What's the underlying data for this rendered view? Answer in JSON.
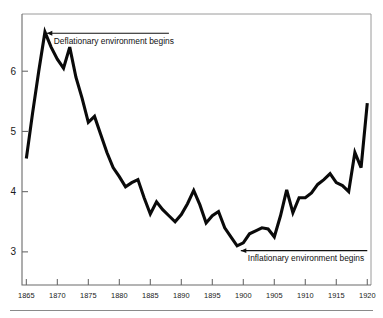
{
  "chart_data": {
    "type": "line",
    "title": "",
    "subtitle": "",
    "xlabel": "",
    "ylabel": "",
    "xlim": [
      1864.3,
      1920.6
    ],
    "ylim": [
      2.45,
      6.95
    ],
    "grid": false,
    "legend_position": "none",
    "x_ticks": [
      1865,
      1870,
      1875,
      1880,
      1885,
      1890,
      1895,
      1900,
      1905,
      1910,
      1915,
      1920
    ],
    "x_tick_labels": [
      "1865",
      "1870",
      "1875",
      "1880",
      "1885",
      "1890",
      "1895",
      "1900",
      "1905",
      "1910",
      "1915",
      "1920"
    ],
    "y_ticks": [
      3,
      4,
      5,
      6
    ],
    "y_tick_labels": [
      "3",
      "4",
      "5",
      "6"
    ],
    "series": [
      {
        "name": "Long-term interest rate",
        "color": "#0a0a0a",
        "x": [
          1865,
          1866,
          1867,
          1868,
          1869,
          1870,
          1871,
          1872,
          1873,
          1874,
          1875,
          1876,
          1877,
          1878,
          1879,
          1880,
          1881,
          1882,
          1883,
          1884,
          1885,
          1886,
          1887,
          1888,
          1889,
          1890,
          1891,
          1892,
          1893,
          1894,
          1895,
          1896,
          1897,
          1898,
          1899,
          1900,
          1901,
          1902,
          1903,
          1904,
          1905,
          1906,
          1907,
          1908,
          1909,
          1910,
          1911,
          1912,
          1913,
          1914,
          1915,
          1916,
          1917,
          1918,
          1919,
          1920
        ],
        "values": [
          4.55,
          5.3,
          6.0,
          6.65,
          6.4,
          6.2,
          6.05,
          6.4,
          5.9,
          5.55,
          5.15,
          5.25,
          4.95,
          4.65,
          4.4,
          4.25,
          4.08,
          4.15,
          4.2,
          3.9,
          3.63,
          3.83,
          3.7,
          3.6,
          3.5,
          3.62,
          3.8,
          4.02,
          3.78,
          3.48,
          3.6,
          3.67,
          3.4,
          3.25,
          3.1,
          3.15,
          3.3,
          3.35,
          3.4,
          3.38,
          3.25,
          3.6,
          4.03,
          3.65,
          3.9,
          3.9,
          3.98,
          4.12,
          4.2,
          4.3,
          4.15,
          4.1,
          4.0,
          4.65,
          4.4,
          5.47
        ]
      }
    ],
    "annotations": [
      {
        "id": "deflationary",
        "text": "Deflationary environment begins",
        "arrow_tip_x": 1868.3,
        "arrow_tail_x": 1888.0,
        "y": 6.63,
        "direction": "left"
      },
      {
        "id": "inflationary",
        "text": "Inflationary environment begins",
        "arrow_tip_x": 1899.6,
        "arrow_tail_x": 1920.0,
        "y": 3.02,
        "direction": "left"
      }
    ]
  }
}
